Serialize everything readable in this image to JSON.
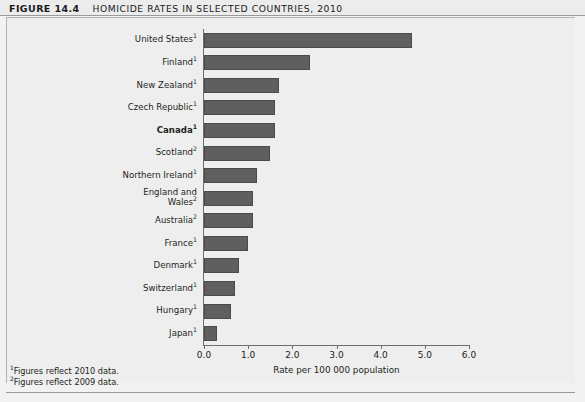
{
  "figure": {
    "number": "FIGURE 14.4",
    "title": "HOMICIDE RATES IN SELECTED COUNTRIES, 2010"
  },
  "footnotes": [
    {
      "marker": "1",
      "text": "Figures reflect 2010 data."
    },
    {
      "marker": "2",
      "text": "Figures reflect 2009 data."
    }
  ],
  "chart_data": {
    "type": "bar",
    "orientation": "horizontal",
    "title": "HOMICIDE RATES IN SELECTED COUNTRIES, 2010",
    "xlabel": "Rate per 100 000 population",
    "ylabel": "",
    "xlim": [
      0.0,
      6.0
    ],
    "xticks": [
      "0.0",
      "1.0",
      "2.0",
      "3.0",
      "4.0",
      "5.0",
      "6.0"
    ],
    "grid": false,
    "legend": false,
    "bar_color": "#5f5f5f",
    "categories": [
      "United States¹",
      "Finland¹",
      "New Zealand¹",
      "Czech Republic¹",
      "Canada¹",
      "Scotland²",
      "Northern Ireland¹",
      "England and Wales²",
      "Australia²",
      "France¹",
      "Denmark¹",
      "Switzerland¹",
      "Hungary¹",
      "Japan¹"
    ],
    "values": [
      4.7,
      2.4,
      1.7,
      1.6,
      1.6,
      1.5,
      1.2,
      1.1,
      1.1,
      1.0,
      0.8,
      0.7,
      0.6,
      0.3
    ],
    "points": [
      {
        "label": "United States",
        "marker": "1",
        "value": 4.7,
        "highlight": false
      },
      {
        "label": "Finland",
        "marker": "1",
        "value": 2.4,
        "highlight": false
      },
      {
        "label": "New Zealand",
        "marker": "1",
        "value": 1.7,
        "highlight": false
      },
      {
        "label": "Czech Republic",
        "marker": "1",
        "value": 1.6,
        "highlight": false
      },
      {
        "label": "Canada",
        "marker": "1",
        "value": 1.6,
        "highlight": true
      },
      {
        "label": "Scotland",
        "marker": "2",
        "value": 1.5,
        "highlight": false
      },
      {
        "label": "Northern Ireland",
        "marker": "1",
        "value": 1.2,
        "highlight": false
      },
      {
        "label": "England and\nWales",
        "marker": "2",
        "value": 1.1,
        "highlight": false
      },
      {
        "label": "Australia",
        "marker": "2",
        "value": 1.1,
        "highlight": false
      },
      {
        "label": "France",
        "marker": "1",
        "value": 1.0,
        "highlight": false
      },
      {
        "label": "Denmark",
        "marker": "1",
        "value": 0.8,
        "highlight": false
      },
      {
        "label": "Switzerland",
        "marker": "1",
        "value": 0.7,
        "highlight": false
      },
      {
        "label": "Hungary",
        "marker": "1",
        "value": 0.6,
        "highlight": false
      },
      {
        "label": "Japan",
        "marker": "1",
        "value": 0.3,
        "highlight": false
      }
    ]
  }
}
